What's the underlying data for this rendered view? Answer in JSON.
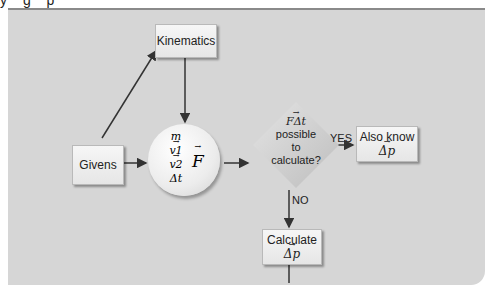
{
  "top_text_cutoff": "y   g p",
  "diagram": {
    "nodes": {
      "givens": {
        "label": "Givens"
      },
      "kinematics": {
        "label": "Kinematics"
      },
      "variables": {
        "items": [
          "m",
          "v1",
          "v2",
          "Δt"
        ],
        "result": "F"
      },
      "decision": {
        "line1": "FΔt",
        "line2": "possible",
        "line3": "to",
        "line4": "calculate?"
      },
      "also_know_p": {
        "line1": "Also know",
        "line2": "Δp"
      },
      "calculate_p": {
        "line1": "Calculate",
        "line2": "Δp"
      },
      "also_know_ft": {
        "line1": "Also know",
        "line2": "FΔt"
      }
    },
    "edge_labels": {
      "yes": "YES",
      "no": "NO"
    },
    "colors": {
      "panel": "#d6d6d6",
      "box": "#efefef",
      "stroke": "#333333"
    }
  }
}
